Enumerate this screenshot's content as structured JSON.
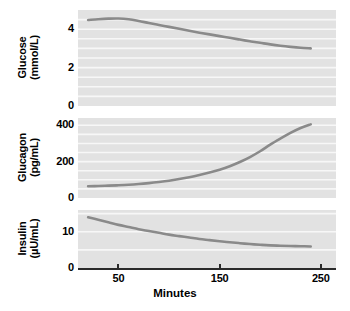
{
  "chart_data": {
    "type": "line",
    "title": "",
    "subtitle": "",
    "xlabel": "Minutes",
    "ylabel": "",
    "grid": true,
    "legend": false,
    "legend_position": "none",
    "x": [
      20,
      30,
      40,
      50,
      60,
      70,
      80,
      90,
      100,
      110,
      120,
      130,
      140,
      150,
      160,
      170,
      180,
      190,
      200,
      210,
      220,
      230,
      240
    ],
    "xlim": [
      10,
      265
    ],
    "xticks": [
      50,
      150,
      250
    ],
    "xticklabels": [
      "50",
      "150",
      "250"
    ],
    "line_color": "#8a8a8a",
    "plot_background": "#e2e2e2",
    "gridline_color": "#f7f7f7",
    "axis_color": "#2b2b2b",
    "panels": [
      {
        "id": "glucose",
        "ylabel_line1": "Glucose",
        "ylabel_line2": "(mmol/L)",
        "units": "mmol/L",
        "analyte": "Glucose",
        "ylim": [
          0,
          5.0
        ],
        "yticks": [
          0,
          2,
          4
        ],
        "yticklabels": [
          "0",
          "2",
          "4"
        ],
        "gridlines": [
          0.5,
          1.0,
          1.5,
          2.0,
          2.5,
          3.0,
          3.5,
          4.0,
          4.5
        ],
        "values": [
          4.48,
          4.52,
          4.55,
          4.56,
          4.52,
          4.43,
          4.32,
          4.22,
          4.12,
          4.02,
          3.92,
          3.82,
          3.73,
          3.64,
          3.55,
          3.46,
          3.37,
          3.29,
          3.21,
          3.14,
          3.08,
          3.03,
          3.0
        ]
      },
      {
        "id": "glucagon",
        "ylabel_line1": "Glucagon",
        "ylabel_line2": "(pg/mL)",
        "units": "pg/mL",
        "analyte": "Glucagon",
        "ylim": [
          0,
          440
        ],
        "yticks": [
          0,
          200,
          400
        ],
        "yticklabels": [
          "0",
          "200",
          "400"
        ],
        "gridlines": [
          50,
          100,
          150,
          200,
          250,
          300,
          350,
          400
        ],
        "values": [
          65,
          66,
          68,
          70,
          73,
          77,
          82,
          88,
          95,
          104,
          114,
          126,
          140,
          156,
          175,
          198,
          225,
          257,
          294,
          327,
          358,
          385,
          405
        ]
      },
      {
        "id": "insulin",
        "ylabel_line1": "Insulin",
        "ylabel_line2": "(µU/mL)",
        "units": "µU/mL",
        "analyte": "Insulin",
        "ylim": [
          0,
          16
        ],
        "yticks": [
          0,
          10
        ],
        "yticklabels": [
          "0",
          "10"
        ],
        "gridlines": [
          5,
          10,
          15
        ],
        "values": [
          14.0,
          13.3,
          12.6,
          11.9,
          11.3,
          10.7,
          10.2,
          9.7,
          9.2,
          8.8,
          8.4,
          8.0,
          7.7,
          7.4,
          7.1,
          6.85,
          6.6,
          6.4,
          6.25,
          6.15,
          6.05,
          6.0,
          5.95
        ]
      }
    ]
  }
}
